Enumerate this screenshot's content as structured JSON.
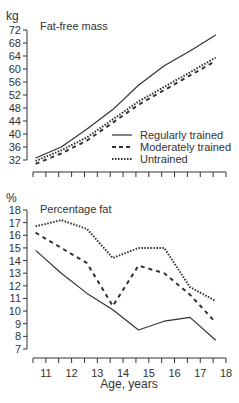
{
  "chart_data": [
    {
      "type": "line",
      "title": "Fat-free mass",
      "ylabel": "kg",
      "xlabel": "",
      "ylim": [
        32,
        72
      ],
      "yticks": [
        32,
        36,
        40,
        44,
        48,
        52,
        56,
        60,
        64,
        68,
        72
      ],
      "xlim": [
        10.5,
        18
      ],
      "x": [
        10.6,
        11.6,
        12.6,
        13.6,
        14.6,
        15.6,
        16.6,
        17.6
      ],
      "series": [
        {
          "name": "Regularly trained",
          "style": "solid",
          "values": [
            32.6,
            36.0,
            41.5,
            47.5,
            55.0,
            61.0,
            65.5,
            70.5
          ]
        },
        {
          "name": "Moderately trained",
          "style": "dashed",
          "values": [
            30.8,
            34.0,
            38.0,
            43.5,
            49.0,
            53.5,
            58.0,
            62.5
          ]
        },
        {
          "name": "Untrained",
          "style": "dotted",
          "values": [
            31.7,
            35.0,
            39.0,
            44.5,
            50.0,
            54.5,
            59.0,
            63.5
          ]
        }
      ],
      "legend": [
        "Regularly trained",
        "Moderately trained",
        "Untrained"
      ],
      "legend_position": "lower right",
      "grid": false
    },
    {
      "type": "line",
      "title": "Percentage fat",
      "ylabel": "%",
      "xlabel": "Age, years",
      "ylim": [
        7,
        18
      ],
      "yticks": [
        7,
        8,
        9,
        10,
        11,
        12,
        13,
        14,
        15,
        16,
        17,
        18
      ],
      "xlim": [
        10.5,
        18
      ],
      "xticks": [
        11,
        12,
        13,
        14,
        15,
        16,
        17,
        18
      ],
      "x": [
        10.6,
        11.6,
        12.6,
        13.6,
        14.6,
        15.6,
        16.6,
        17.6
      ],
      "series": [
        {
          "name": "Regularly trained",
          "style": "solid",
          "values": [
            14.8,
            13.0,
            11.4,
            10.1,
            8.5,
            9.2,
            9.5,
            7.7
          ]
        },
        {
          "name": "Moderately trained",
          "style": "dashed",
          "values": [
            16.2,
            15.0,
            13.8,
            10.4,
            13.6,
            13.0,
            11.3,
            9.1
          ]
        },
        {
          "name": "Untrained",
          "style": "dotted",
          "values": [
            16.7,
            17.2,
            16.5,
            14.2,
            15.0,
            15.0,
            11.9,
            10.8
          ]
        }
      ],
      "grid": false
    }
  ],
  "labels": {
    "top_unit": "kg",
    "top_title": "Fat-free mass",
    "bottom_unit": "%",
    "bottom_title": "Percentage fat",
    "x_axis_title": "Age, years",
    "legend": [
      "Regularly trained",
      "Moderately trained",
      "Untrained"
    ]
  }
}
